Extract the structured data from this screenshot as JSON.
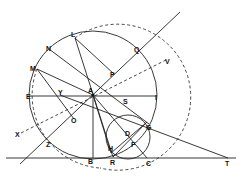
{
  "diagram": {
    "title": "",
    "points": [
      {
        "id": "A",
        "label": "A"
      },
      {
        "id": "B",
        "label": "B"
      },
      {
        "id": "C",
        "label": "C"
      },
      {
        "id": "D",
        "label": "D"
      },
      {
        "id": "E",
        "label": "E"
      },
      {
        "id": "F",
        "label": "F"
      },
      {
        "id": "G",
        "label": "G"
      },
      {
        "id": "H",
        "label": "H"
      },
      {
        "id": "I",
        "label": "I"
      },
      {
        "id": "L",
        "label": "L"
      },
      {
        "id": "M",
        "label": "M"
      },
      {
        "id": "N",
        "label": "N"
      },
      {
        "id": "O",
        "label": "O"
      },
      {
        "id": "P",
        "label": "P"
      },
      {
        "id": "Q",
        "label": "Q"
      },
      {
        "id": "R",
        "label": "R"
      },
      {
        "id": "S",
        "label": "S"
      },
      {
        "id": "T",
        "label": "T"
      },
      {
        "id": "V",
        "label": "V"
      },
      {
        "id": "X",
        "label": "X"
      },
      {
        "id": "Y",
        "label": "Y"
      },
      {
        "id": "Z",
        "label": "Z"
      }
    ],
    "elements": {
      "main_circle": "circle centered at A (solid)",
      "dashed_circle": "larger dashed circle",
      "small_circle": "small circle through H, D, G, C (solid)",
      "baseline": "horizontal line through B, R, C, T",
      "tangent": "line G–T"
    }
  }
}
